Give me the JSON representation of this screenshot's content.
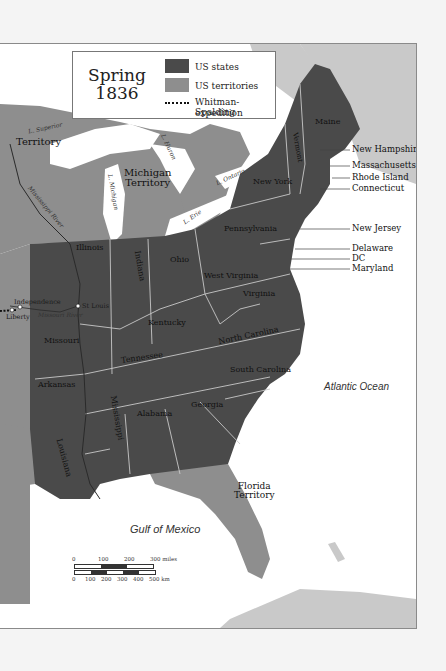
{
  "map": {
    "title_line1": "Spring",
    "title_line2": "1836",
    "colors": {
      "states": "#4a4a4a",
      "territories": "#8e8e8e",
      "water": "#ffffff",
      "foreign_land": "#c9c9c9",
      "border": "#bdbdbd"
    },
    "legend": [
      {
        "label": "US states",
        "swatch": "states"
      },
      {
        "label": "US territories",
        "swatch": "territories"
      },
      {
        "label": "Whitman-Spalding",
        "label2": "expedition",
        "swatch": "dotted-line"
      }
    ],
    "states": [
      {
        "name": "Maine"
      },
      {
        "name": "Vermont"
      },
      {
        "name": "New York"
      },
      {
        "name": "Pennsylvania"
      },
      {
        "name": "Ohio"
      },
      {
        "name": "Indiana"
      },
      {
        "name": "Illinois"
      },
      {
        "name": "West Virginia"
      },
      {
        "name": "Virginia"
      },
      {
        "name": "Kentucky"
      },
      {
        "name": "Missouri"
      },
      {
        "name": "Tennessee"
      },
      {
        "name": "North Carolina"
      },
      {
        "name": "South Carolina"
      },
      {
        "name": "Georgia"
      },
      {
        "name": "Alabama"
      },
      {
        "name": "Mississippi"
      },
      {
        "name": "Arkansas"
      },
      {
        "name": "Louisiana"
      }
    ],
    "territories": [
      {
        "name": "Territory"
      },
      {
        "name": "Michigan Territory",
        "line1": "Michigan",
        "line2": "Territory"
      },
      {
        "name": "Florida Territory",
        "line1": "Florida",
        "line2": "Territory"
      }
    ],
    "callout_states": [
      "New Hampshire",
      "Massachusetts",
      "Rhode Island",
      "Connecticut",
      "New Jersey",
      "Delaware",
      "DC",
      "Maryland"
    ],
    "lakes": [
      "L. Superior",
      "L. Michigan",
      "L. Huron",
      "L. Erie",
      "L. Ontario"
    ],
    "rivers": [
      "Mississippi River",
      "Missouri River"
    ],
    "cities": [
      "Independence",
      "Liberty",
      "St Louis"
    ],
    "oceans": [
      "Atlantic Ocean",
      "Gulf of Mexico"
    ],
    "scale": {
      "miles_ticks": [
        "0",
        "100",
        "200",
        "300 miles"
      ],
      "km_ticks": [
        "0",
        "100",
        "200",
        "300",
        "400",
        "500 km"
      ]
    }
  }
}
